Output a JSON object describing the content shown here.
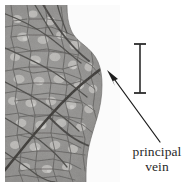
{
  "figure": {
    "kind": "leaf-venation-micrograph",
    "background_color": "#ffffff"
  },
  "photo": {
    "subject": "leaf surface showing reticulate venation",
    "color_mode": "grayscale",
    "base_tone": "#8f8e8c",
    "vein_tone": "#4b4a48",
    "principal_vein_tone": "#3a3937",
    "areole_highlight_tone": "#c9c8c5",
    "background_outside_leaf": "#fbfbfb",
    "margin_description": "leaf edge runs down the right side with a concave notch near the top"
  },
  "scale_bar": {
    "name": "scale-bar",
    "orientation": "vertical",
    "color": "#2b2b2b",
    "label": ""
  },
  "annotation": {
    "arrow": {
      "color": "#1c1c1c",
      "points_to": "principal vein"
    },
    "label_lines": [
      "principal",
      "vein"
    ],
    "label_color": "#2a2a2a"
  }
}
